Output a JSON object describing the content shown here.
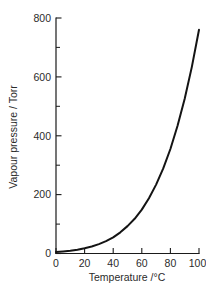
{
  "chart_data": {
    "type": "line",
    "title": "",
    "subtitle": "",
    "xlabel": "Temperature /°C",
    "ylabel": "Vapour pressure / Torr",
    "xlim": [
      0,
      100
    ],
    "ylim": [
      0,
      800
    ],
    "grid": false,
    "legend": false,
    "legend_position": "none",
    "x_ticks": [
      0,
      20,
      40,
      60,
      80,
      100
    ],
    "x_tick_labels": [
      "0",
      "20",
      "40",
      "60",
      "80",
      "100"
    ],
    "y_ticks": [
      0,
      200,
      400,
      600,
      800
    ],
    "y_tick_labels": [
      "0",
      "200",
      "400",
      "600",
      "800"
    ],
    "y_minor_ticks": [
      100,
      300,
      500,
      700
    ],
    "x": [
      0,
      5,
      10,
      15,
      20,
      25,
      30,
      35,
      40,
      45,
      50,
      55,
      60,
      65,
      70,
      75,
      80,
      85,
      90,
      95,
      100
    ],
    "values": [
      5,
      7,
      9,
      13,
      18,
      24,
      32,
      42,
      55,
      72,
      93,
      118,
      149,
      188,
      234,
      289,
      355,
      434,
      526,
      634,
      760
    ],
    "series": [
      {
        "name": "Vapour pressure of water",
        "x": [
          0,
          5,
          10,
          15,
          20,
          25,
          30,
          35,
          40,
          45,
          50,
          55,
          60,
          65,
          70,
          75,
          80,
          85,
          90,
          95,
          100
        ],
        "values": [
          5,
          7,
          9,
          13,
          18,
          24,
          32,
          42,
          55,
          72,
          93,
          118,
          149,
          188,
          234,
          289,
          355,
          434,
          526,
          634,
          760
        ],
        "color": "#141414"
      }
    ],
    "axis_color": "#1a1a1a",
    "text_color": "#2b2b2b",
    "background": "#ffffff"
  },
  "axes": {
    "x_axis_name": "temperature-axis",
    "y_axis_name": "vapour-pressure-axis"
  }
}
